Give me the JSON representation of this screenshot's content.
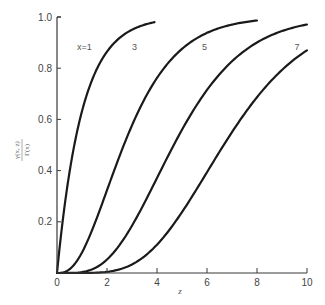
{
  "chart_data": {
    "type": "line",
    "title": "",
    "function": "normalized lower incomplete gamma function P(x, z) = γ(x, z) / Γ(x)",
    "xlabel": "z",
    "ylabel_numerator": "γ(x, z)",
    "ylabel_denominator": "Γ(x)",
    "xlim": [
      0,
      10
    ],
    "ylim": [
      0,
      1.0
    ],
    "xticks": [
      0,
      2,
      4,
      6,
      8,
      10
    ],
    "xtick_labels": [
      "0",
      "2",
      "4",
      "6",
      "8",
      "10"
    ],
    "yticks": [
      0.2,
      0.4,
      0.6,
      0.8,
      1.0
    ],
    "ytick_labels": [
      "0.2",
      "0.4",
      "0.6",
      "0.8",
      "1.0"
    ],
    "grid": false,
    "legend": "inline labels",
    "series": [
      {
        "name": "x=1",
        "label": "x=1",
        "x_param": 1,
        "z_range": [
          0,
          3.9
        ],
        "sample_points": [
          [
            0,
            0
          ],
          [
            0.5,
            0.39
          ],
          [
            1,
            0.63
          ],
          [
            1.5,
            0.78
          ],
          [
            2,
            0.86
          ],
          [
            3,
            0.95
          ],
          [
            3.9,
            0.98
          ]
        ],
        "label_pos": [
          1.1,
          0.87
        ]
      },
      {
        "name": "x=3",
        "label": "3",
        "x_param": 3,
        "z_range": [
          0,
          8.0
        ],
        "sample_points": [
          [
            0,
            0
          ],
          [
            1,
            0.08
          ],
          [
            2,
            0.32
          ],
          [
            3,
            0.58
          ],
          [
            4,
            0.76
          ],
          [
            5,
            0.88
          ],
          [
            6,
            0.94
          ],
          [
            7,
            0.97
          ],
          [
            8,
            0.99
          ]
        ],
        "label_pos": [
          3.1,
          0.87
        ]
      },
      {
        "name": "x=5",
        "label": "5",
        "x_param": 5,
        "z_range": [
          0,
          10
        ],
        "sample_points": [
          [
            0,
            0
          ],
          [
            1,
            0.004
          ],
          [
            2,
            0.05
          ],
          [
            3,
            0.18
          ],
          [
            4,
            0.37
          ],
          [
            5,
            0.56
          ],
          [
            6,
            0.71
          ],
          [
            7,
            0.83
          ],
          [
            8,
            0.9
          ],
          [
            9,
            0.95
          ],
          [
            10,
            0.97
          ]
        ],
        "label_pos": [
          5.9,
          0.87
        ]
      },
      {
        "name": "x=7",
        "label": "7",
        "x_param": 7,
        "z_range": [
          0,
          10
        ],
        "sample_points": [
          [
            0,
            0
          ],
          [
            2,
            0.005
          ],
          [
            3,
            0.03
          ],
          [
            4,
            0.11
          ],
          [
            5,
            0.24
          ],
          [
            6,
            0.39
          ],
          [
            7,
            0.55
          ],
          [
            8,
            0.69
          ],
          [
            9,
            0.79
          ],
          [
            10,
            0.87
          ]
        ],
        "label_pos": [
          9.6,
          0.87
        ]
      }
    ]
  },
  "plot_area": {
    "origin_px": [
      57,
      273
    ],
    "px_per_x": 25,
    "px_per_y": 256
  }
}
